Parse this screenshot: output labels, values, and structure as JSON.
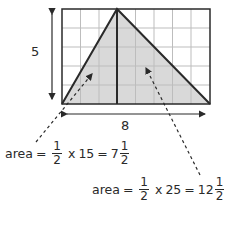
{
  "grid": {
    "columns": 8,
    "rows": 5,
    "apex_column": 3
  },
  "labels": {
    "height": "5",
    "width": "8"
  },
  "equation_left": {
    "word": "area",
    "eq1": "=",
    "frac_num": "1",
    "frac_den": "2",
    "times": "x",
    "value": "15",
    "eq2": "=",
    "whole": "7",
    "res_num": "1",
    "res_den": "2"
  },
  "equation_right": {
    "word": "area",
    "eq1": "=",
    "frac_num": "1",
    "frac_den": "2",
    "times": "x",
    "value": "25",
    "eq2": "=",
    "whole": "12",
    "res_num": "1",
    "res_den": "2"
  },
  "colors": {
    "fill": "#d9d9d9",
    "grid": "#bdbdbd",
    "line": "#2a2a2a"
  }
}
